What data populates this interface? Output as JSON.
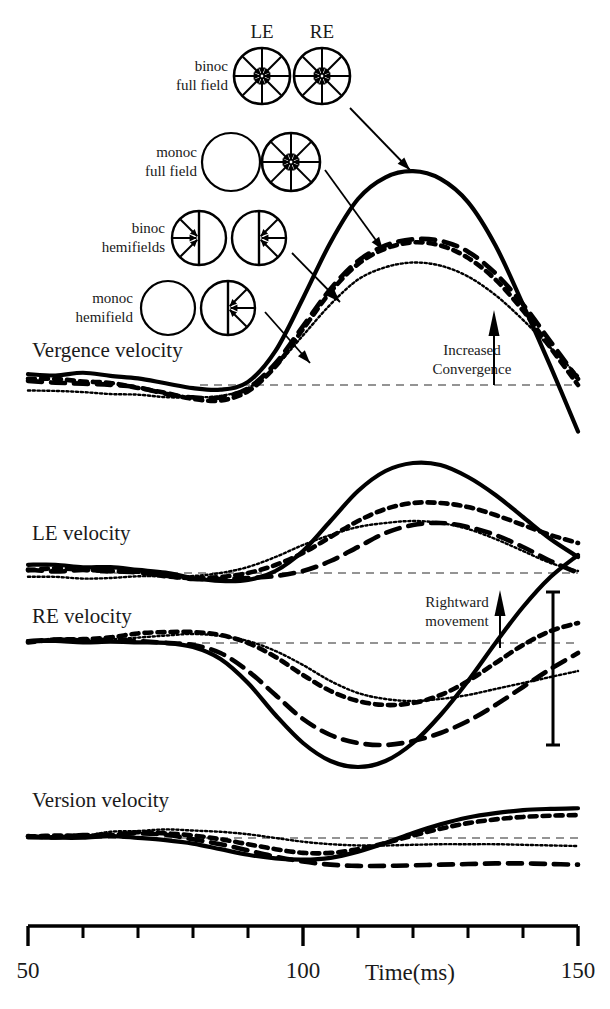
{
  "figure": {
    "background": "#ffffff",
    "ink": "#000000"
  },
  "eye_headers": [
    {
      "id": "le",
      "label": "LE"
    },
    {
      "id": "re",
      "label": "RE"
    }
  ],
  "legend": {
    "conditions": [
      {
        "id": "binoc-full-field",
        "label_line1": "binoc",
        "label_line2": "full field",
        "line_style": "solid",
        "le_icon": "full-field-arrows-icon",
        "re_icon": "full-field-arrows-icon"
      },
      {
        "id": "monoc-full-field",
        "label_line1": "monoc",
        "label_line2": "full field",
        "line_style": "dashed",
        "le_icon": "empty-circle-icon",
        "re_icon": "full-field-arrows-icon"
      },
      {
        "id": "binoc-hemifields",
        "label_line1": "binoc",
        "label_line2": "hemifields",
        "line_style": "dotted-thick",
        "le_icon": "left-hemifield-arrows-icon",
        "re_icon": "right-hemifield-arrows-icon"
      },
      {
        "id": "monoc-hemifield",
        "label_line1": "monoc",
        "label_line2": "hemifield",
        "line_style": "dotted-fine",
        "le_icon": "empty-circle-icon",
        "re_icon": "right-hemifield-arrows-icon"
      }
    ]
  },
  "panels": [
    {
      "id": "vergence",
      "label": "Vergence velocity"
    },
    {
      "id": "le",
      "label": "LE velocity"
    },
    {
      "id": "re",
      "label": "RE velocity"
    },
    {
      "id": "version",
      "label": "Version velocity"
    }
  ],
  "annotations": [
    {
      "id": "increased-convergence",
      "line1": "Increased",
      "line2": "Convergence",
      "arrow": "up-arrow-icon",
      "panel": "vergence"
    },
    {
      "id": "rightward-movement",
      "line1": "Rightward",
      "line2": "movement",
      "arrow": "up-arrow-icon",
      "panel": "re"
    }
  ],
  "scale_bar": {
    "id": "vertical-scale-bar",
    "panel": "re",
    "label": ""
  },
  "axis": {
    "label": "Time(ms)",
    "ticks": [
      {
        "value": 50,
        "label": "50",
        "major": true
      },
      {
        "value": 60,
        "label": "",
        "major": false
      },
      {
        "value": 70,
        "label": "",
        "major": false
      },
      {
        "value": 80,
        "label": "",
        "major": false
      },
      {
        "value": 90,
        "label": "",
        "major": false
      },
      {
        "value": 100,
        "label": "100",
        "major": true
      },
      {
        "value": 110,
        "label": "",
        "major": false
      },
      {
        "value": 120,
        "label": "",
        "major": false
      },
      {
        "value": 130,
        "label": "",
        "major": false
      },
      {
        "value": 140,
        "label": "",
        "major": false
      },
      {
        "value": 150,
        "label": "150",
        "major": true
      }
    ],
    "min": 50,
    "max": 150,
    "unit": "ms"
  },
  "chart_data": {
    "type": "line",
    "xlabel": "Time(ms)",
    "ylabel": "velocity (arbitrary units)",
    "xlim": [
      50,
      150
    ],
    "grid": false,
    "legend_position": "upper-left-icons",
    "x": [
      50,
      55,
      60,
      65,
      70,
      75,
      80,
      85,
      90,
      95,
      100,
      105,
      110,
      115,
      120,
      125,
      130,
      135,
      140,
      145,
      150
    ],
    "panels": [
      {
        "name": "Vergence velocity",
        "baseline": 0,
        "series": [
          {
            "name": "binoc full field",
            "style": "solid",
            "values": [
              0.06,
              0.07,
              0.07,
              0.06,
              0.04,
              0.01,
              -0.02,
              -0.03,
              0.02,
              0.22,
              0.56,
              0.92,
              1.2,
              1.34,
              1.38,
              1.33,
              1.18,
              0.9,
              0.52,
              0.12,
              -0.3
            ]
          },
          {
            "name": "monoc full field",
            "style": "dashed",
            "values": [
              0.02,
              0.02,
              0.01,
              0.0,
              -0.02,
              -0.05,
              -0.08,
              -0.08,
              -0.02,
              0.14,
              0.38,
              0.62,
              0.8,
              0.9,
              0.94,
              0.93,
              0.86,
              0.72,
              0.52,
              0.28,
              0.04
            ]
          },
          {
            "name": "binoc hemifields",
            "style": "dotted-thick",
            "values": [
              0.03,
              0.03,
              0.02,
              0.01,
              -0.01,
              -0.05,
              -0.09,
              -0.1,
              -0.04,
              0.12,
              0.36,
              0.6,
              0.78,
              0.88,
              0.92,
              0.9,
              0.82,
              0.68,
              0.48,
              0.24,
              0.0
            ]
          },
          {
            "name": "monoc hemifield",
            "style": "dotted-fine",
            "values": [
              -0.04,
              -0.04,
              -0.05,
              -0.05,
              -0.06,
              -0.07,
              -0.08,
              -0.07,
              -0.02,
              0.12,
              0.32,
              0.52,
              0.68,
              0.76,
              0.79,
              0.77,
              0.7,
              0.58,
              0.42,
              0.24,
              0.06
            ]
          }
        ]
      },
      {
        "name": "LE velocity",
        "baseline": 0,
        "series": [
          {
            "name": "binoc full field",
            "style": "solid",
            "values": [
              0.07,
              0.07,
              0.07,
              0.06,
              0.04,
              0.0,
              -0.05,
              -0.08,
              -0.07,
              0.02,
              0.22,
              0.52,
              0.82,
              1.02,
              1.1,
              1.08,
              0.96,
              0.78,
              0.56,
              0.34,
              0.16
            ]
          },
          {
            "name": "monoc full field",
            "style": "dashed",
            "values": [
              0.03,
              0.03,
              0.02,
              0.01,
              -0.01,
              -0.04,
              -0.06,
              -0.06,
              -0.05,
              -0.03,
              0.02,
              0.12,
              0.26,
              0.4,
              0.48,
              0.5,
              0.46,
              0.38,
              0.26,
              0.12,
              0.0
            ]
          },
          {
            "name": "binoc hemifields",
            "style": "dotted-thick",
            "values": [
              0.04,
              0.04,
              0.03,
              0.02,
              0.0,
              -0.03,
              -0.05,
              -0.04,
              0.0,
              0.08,
              0.2,
              0.36,
              0.52,
              0.64,
              0.7,
              0.7,
              0.66,
              0.58,
              0.48,
              0.38,
              0.3
            ]
          },
          {
            "name": "monoc hemifield",
            "style": "dotted-fine",
            "values": [
              -0.03,
              -0.03,
              -0.04,
              -0.04,
              -0.04,
              -0.04,
              -0.03,
              0.0,
              0.06,
              0.16,
              0.28,
              0.38,
              0.46,
              0.5,
              0.52,
              0.5,
              0.44,
              0.34,
              0.22,
              0.1,
              0.02
            ]
          }
        ]
      },
      {
        "name": "RE velocity",
        "baseline": 0,
        "series": [
          {
            "name": "binoc full field",
            "style": "solid",
            "values": [
              0.02,
              0.02,
              0.02,
              0.02,
              0.01,
              0.0,
              -0.04,
              -0.16,
              -0.4,
              -0.72,
              -1.0,
              -1.18,
              -1.24,
              -1.18,
              -1.0,
              -0.72,
              -0.38,
              0.0,
              0.36,
              0.66,
              0.88
            ]
          },
          {
            "name": "monoc full field",
            "style": "dashed",
            "values": [
              0.02,
              0.02,
              0.02,
              0.02,
              0.02,
              0.01,
              -0.02,
              -0.1,
              -0.28,
              -0.52,
              -0.76,
              -0.92,
              -1.0,
              -1.02,
              -0.98,
              -0.9,
              -0.78,
              -0.62,
              -0.44,
              -0.26,
              -0.1
            ]
          },
          {
            "name": "binoc hemifields",
            "style": "dotted-thick",
            "values": [
              0.02,
              0.03,
              0.04,
              0.06,
              0.09,
              0.11,
              0.11,
              0.08,
              0.0,
              -0.14,
              -0.32,
              -0.48,
              -0.58,
              -0.62,
              -0.6,
              -0.52,
              -0.38,
              -0.2,
              -0.02,
              0.12,
              0.2
            ]
          },
          {
            "name": "monoc hemifield",
            "style": "dotted-fine",
            "values": [
              0.01,
              0.02,
              0.03,
              0.05,
              0.07,
              0.09,
              0.09,
              0.07,
              0.02,
              -0.08,
              -0.22,
              -0.38,
              -0.5,
              -0.56,
              -0.58,
              -0.56,
              -0.52,
              -0.46,
              -0.4,
              -0.34,
              -0.28
            ]
          }
        ]
      },
      {
        "name": "Version velocity",
        "baseline": 0,
        "series": [
          {
            "name": "binoc full field",
            "style": "solid",
            "values": [
              0.02,
              0.02,
              0.02,
              0.01,
              0.0,
              -0.03,
              -0.09,
              -0.18,
              -0.27,
              -0.33,
              -0.35,
              -0.32,
              -0.22,
              -0.08,
              0.08,
              0.22,
              0.33,
              0.4,
              0.45,
              0.47,
              0.48
            ]
          },
          {
            "name": "monoc full field",
            "style": "dashed",
            "values": [
              0.02,
              0.03,
              0.04,
              0.05,
              0.05,
              0.03,
              -0.02,
              -0.1,
              -0.2,
              -0.3,
              -0.38,
              -0.43,
              -0.45,
              -0.45,
              -0.44,
              -0.43,
              -0.42,
              -0.41,
              -0.41,
              -0.42,
              -0.43
            ]
          },
          {
            "name": "binoc hemifields",
            "style": "dotted-thick",
            "values": [
              0.02,
              0.03,
              0.05,
              0.07,
              0.08,
              0.07,
              0.04,
              -0.02,
              -0.1,
              -0.18,
              -0.24,
              -0.24,
              -0.18,
              -0.08,
              0.04,
              0.15,
              0.24,
              0.3,
              0.34,
              0.36,
              0.37
            ]
          },
          {
            "name": "monoc hemifield",
            "style": "dotted-fine",
            "values": [
              0.0,
              0.02,
              0.05,
              0.08,
              0.11,
              0.12,
              0.12,
              0.1,
              0.06,
              0.0,
              -0.06,
              -0.1,
              -0.12,
              -0.12,
              -0.11,
              -0.1,
              -0.1,
              -0.1,
              -0.11,
              -0.12,
              -0.13
            ]
          }
        ]
      }
    ]
  }
}
